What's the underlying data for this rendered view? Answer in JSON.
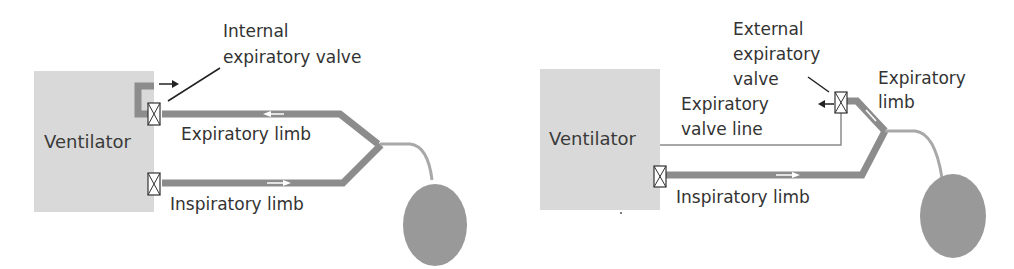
{
  "left_diagram": {
    "ventilator_label": "Ventilator",
    "valve_label_line1": "Internal",
    "valve_label_line2": "expiratory valve",
    "expiratory_limb_label": "Expiratory limb",
    "inspiratory_limb_label": "Inspiratory limb"
  },
  "right_diagram": {
    "ventilator_label": "Ventilator",
    "valve_label_line1": "External",
    "valve_label_line2": "expiratory",
    "valve_label_line3": "valve",
    "valve_line_label_line1": "Expiratory",
    "valve_line_label_line2": "valve line",
    "expiratory_limb_label_line1": "Expiratory",
    "expiratory_limb_label_line2": "limb",
    "inspiratory_limb_label": "Inspiratory limb"
  },
  "colors": {
    "ventilator_box": "#d8d8d8",
    "tube": "#8c8c8c",
    "lung": "#999999",
    "line": "#333333"
  }
}
